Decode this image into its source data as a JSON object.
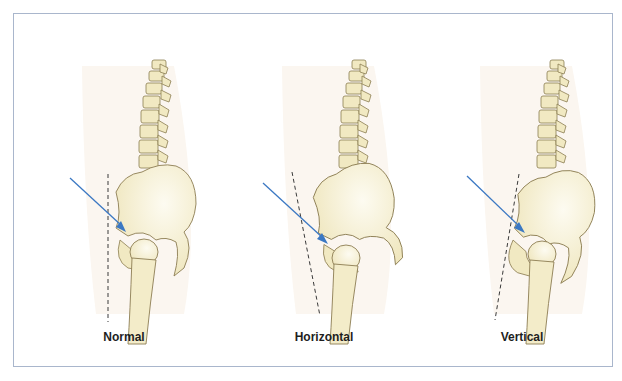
{
  "figure": {
    "panels": [
      {
        "id": "normal",
        "label": "Normal",
        "pelvic_tilt_deg": 0,
        "dash_line_angle": "vertical"
      },
      {
        "id": "horizontal",
        "label": "Horizontal",
        "pelvic_tilt_deg": -12,
        "dash_line_angle": "tilted-back"
      },
      {
        "id": "vertical",
        "label": "Vertical",
        "pelvic_tilt_deg": 10,
        "dash_line_angle": "tilted-forward"
      }
    ],
    "colors": {
      "bone_fill": "#f1e9c2",
      "bone_highlight": "#fbf8ea",
      "bone_outline": "#8c7d52",
      "arrow": "#3b78c3",
      "dash_line": "#3a3a3a",
      "body_silhouette": "#fbf6f0",
      "frame_border": "#a9b6cc",
      "label_text": "#1e1e1e"
    }
  }
}
